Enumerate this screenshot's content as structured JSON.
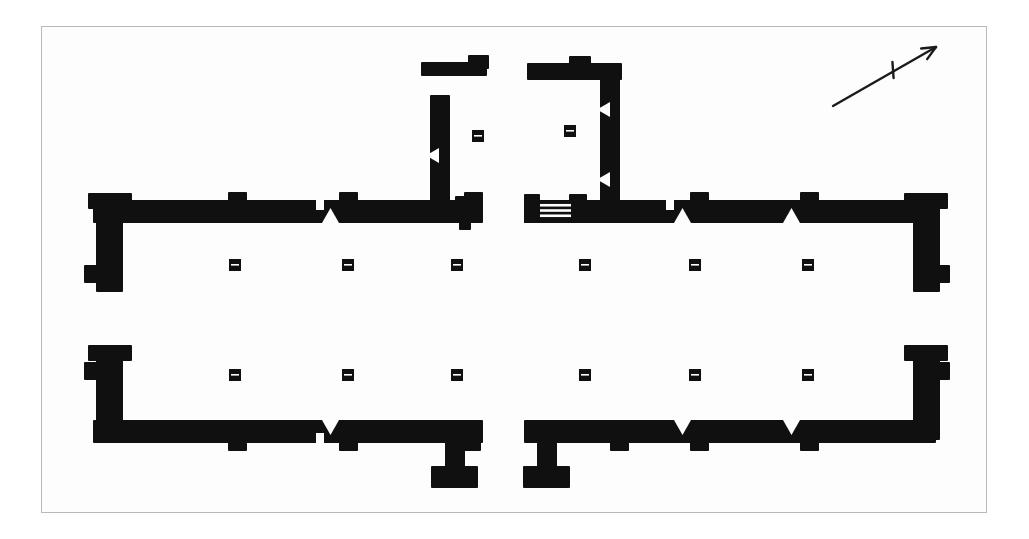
{
  "document": {
    "kind": "architectural-floor-plan",
    "title": "",
    "background_color": "#ffffff",
    "paper_color": "#fdfdfd",
    "ink_color": "#101010",
    "frame_color": "#b9b9b9"
  },
  "canvas": {
    "width": 1029,
    "height": 539
  },
  "frame": {
    "x": 41,
    "y": 26,
    "width": 946,
    "height": 487,
    "stroke": "#b9b9b9",
    "stroke_width": 1
  },
  "north_arrow": {
    "label": "north-arrow",
    "tail": {
      "x": 833,
      "y": 106
    },
    "head": {
      "x": 936,
      "y": 47
    },
    "tick_center": {
      "x": 893,
      "y": 70
    },
    "stroke": "#1b1b1b",
    "stroke_width": 2.4,
    "head_size": 15
  },
  "walls": [
    {
      "name": "upper-left-spine",
      "x": 93,
      "y": 200,
      "w": 390,
      "h": 23
    },
    {
      "name": "upper-right-spine",
      "x": 524,
      "y": 200,
      "w": 412,
      "h": 23
    },
    {
      "name": "lower-left-spine",
      "x": 93,
      "y": 420,
      "w": 390,
      "h": 23
    },
    {
      "name": "lower-right-spine",
      "x": 524,
      "y": 420,
      "w": 412,
      "h": 23
    },
    {
      "name": "upper-left-end-pier",
      "x": 96,
      "y": 204,
      "w": 27,
      "h": 88
    },
    {
      "name": "upper-right-end-pier",
      "x": 913,
      "y": 204,
      "w": 27,
      "h": 88
    },
    {
      "name": "lower-left-end-pier",
      "x": 96,
      "y": 352,
      "w": 27,
      "h": 88
    },
    {
      "name": "lower-right-end-pier",
      "x": 913,
      "y": 352,
      "w": 27,
      "h": 88
    },
    {
      "name": "upper-left-end-cap",
      "x": 88,
      "y": 193,
      "w": 44,
      "h": 16
    },
    {
      "name": "upper-right-end-cap",
      "x": 904,
      "y": 193,
      "w": 44,
      "h": 16
    },
    {
      "name": "lower-left-end-cap",
      "x": 88,
      "y": 345,
      "w": 44,
      "h": 16
    },
    {
      "name": "lower-right-end-cap",
      "x": 904,
      "y": 345,
      "w": 44,
      "h": 16
    },
    {
      "name": "upper-left-foot-spur",
      "x": 84,
      "y": 265,
      "w": 22,
      "h": 18
    },
    {
      "name": "upper-right-foot-spur",
      "x": 928,
      "y": 265,
      "w": 22,
      "h": 18
    },
    {
      "name": "lower-left-foot-spur",
      "x": 84,
      "y": 362,
      "w": 22,
      "h": 18
    },
    {
      "name": "lower-right-foot-spur",
      "x": 928,
      "y": 362,
      "w": 22,
      "h": 18
    },
    {
      "name": "court-left-cross-wall",
      "x": 430,
      "y": 95,
      "w": 20,
      "h": 112
    },
    {
      "name": "court-right-cross-wall",
      "x": 600,
      "y": 72,
      "w": 20,
      "h": 135
    },
    {
      "name": "court-right-head-wall",
      "x": 527,
      "y": 63,
      "w": 95,
      "h": 17
    },
    {
      "name": "court-right-head-knob",
      "x": 569,
      "y": 56,
      "w": 22,
      "h": 14
    },
    {
      "name": "detached-upper-wall",
      "x": 421,
      "y": 62,
      "w": 66,
      "h": 14
    },
    {
      "name": "detached-upper-knob",
      "x": 468,
      "y": 55,
      "w": 21,
      "h": 14
    },
    {
      "name": "court-left-base-pier",
      "x": 455,
      "y": 196,
      "w": 19,
      "h": 14
    },
    {
      "name": "court-left-base-foot",
      "x": 459,
      "y": 219,
      "w": 12,
      "h": 11
    },
    {
      "name": "stair-landing-block",
      "x": 524,
      "y": 194,
      "w": 16,
      "h": 29
    },
    {
      "name": "stair-right-pier",
      "x": 569,
      "y": 194,
      "w": 18,
      "h": 16
    },
    {
      "name": "lower-center-left-stem",
      "x": 445,
      "y": 441,
      "w": 20,
      "h": 35
    },
    {
      "name": "lower-center-left-foot",
      "x": 431,
      "y": 466,
      "w": 47,
      "h": 22
    },
    {
      "name": "lower-center-right-stem",
      "x": 537,
      "y": 441,
      "w": 20,
      "h": 35
    },
    {
      "name": "lower-center-right-foot",
      "x": 523,
      "y": 466,
      "w": 47,
      "h": 22
    },
    {
      "name": "upper-left-spine-pier-a",
      "x": 228,
      "y": 192,
      "w": 19,
      "h": 16
    },
    {
      "name": "upper-left-spine-pier-b",
      "x": 339,
      "y": 192,
      "w": 19,
      "h": 16
    },
    {
      "name": "upper-left-spine-pier-c",
      "x": 464,
      "y": 192,
      "w": 19,
      "h": 16
    },
    {
      "name": "upper-right-spine-pier-a",
      "x": 690,
      "y": 192,
      "w": 19,
      "h": 16
    },
    {
      "name": "upper-right-spine-pier-b",
      "x": 800,
      "y": 192,
      "w": 19,
      "h": 16
    },
    {
      "name": "lower-left-spine-pier-a",
      "x": 228,
      "y": 435,
      "w": 19,
      "h": 16
    },
    {
      "name": "lower-left-spine-pier-b",
      "x": 339,
      "y": 435,
      "w": 19,
      "h": 16
    },
    {
      "name": "lower-right-spine-pier-a",
      "x": 690,
      "y": 435,
      "w": 19,
      "h": 16
    },
    {
      "name": "lower-right-spine-pier-b",
      "x": 800,
      "y": 435,
      "w": 19,
      "h": 16
    },
    {
      "name": "lower-left-spine-pier-c",
      "x": 462,
      "y": 435,
      "w": 19,
      "h": 16
    },
    {
      "name": "lower-right-spine-pier-c",
      "x": 610,
      "y": 435,
      "w": 19,
      "h": 16
    }
  ],
  "columns": [
    {
      "name": "column-u1",
      "x": 235,
      "y": 265
    },
    {
      "name": "column-u2",
      "x": 348,
      "y": 265
    },
    {
      "name": "column-u3",
      "x": 457,
      "y": 265
    },
    {
      "name": "column-u4",
      "x": 585,
      "y": 265
    },
    {
      "name": "column-u5",
      "x": 695,
      "y": 265
    },
    {
      "name": "column-u6",
      "x": 808,
      "y": 265
    },
    {
      "name": "column-l1",
      "x": 235,
      "y": 375
    },
    {
      "name": "column-l2",
      "x": 348,
      "y": 375
    },
    {
      "name": "column-l3",
      "x": 457,
      "y": 375
    },
    {
      "name": "column-l4",
      "x": 585,
      "y": 375
    },
    {
      "name": "column-l5",
      "x": 695,
      "y": 375
    },
    {
      "name": "column-l6",
      "x": 808,
      "y": 375
    },
    {
      "name": "column-court-left",
      "x": 478,
      "y": 136
    },
    {
      "name": "column-court-right",
      "x": 570,
      "y": 131
    }
  ],
  "column_size": {
    "w": 12,
    "h": 12
  },
  "doorway_notches": [
    {
      "name": "doorway-upper-a",
      "x": 322,
      "y": 223,
      "dir": "up",
      "w": 17,
      "h": 15
    },
    {
      "name": "doorway-upper-b",
      "x": 674,
      "y": 223,
      "dir": "up",
      "w": 17,
      "h": 15
    },
    {
      "name": "doorway-upper-c",
      "x": 783,
      "y": 223,
      "dir": "up",
      "w": 17,
      "h": 15
    },
    {
      "name": "doorway-court-left",
      "x": 439,
      "y": 148,
      "dir": "left",
      "w": 13,
      "h": 15
    },
    {
      "name": "doorway-court-right-upper",
      "x": 610,
      "y": 102,
      "dir": "left",
      "w": 13,
      "h": 15
    },
    {
      "name": "doorway-court-right-lower",
      "x": 610,
      "y": 172,
      "dir": "left",
      "w": 13,
      "h": 15
    },
    {
      "name": "doorway-lower-a",
      "x": 322,
      "y": 420,
      "dir": "down",
      "w": 17,
      "h": 15
    },
    {
      "name": "doorway-lower-b",
      "x": 674,
      "y": 420,
      "dir": "down",
      "w": 17,
      "h": 15
    },
    {
      "name": "doorway-lower-c",
      "x": 783,
      "y": 420,
      "dir": "down",
      "w": 17,
      "h": 15
    }
  ],
  "stair": {
    "name": "stair-flight",
    "x": 540,
    "y": 200,
    "width": 31,
    "height": 21,
    "tread_count": 3
  },
  "wall_breaks": [
    {
      "name": "wall-break-upper-left",
      "x": 316,
      "y": 199,
      "w": 8,
      "h": 11
    },
    {
      "name": "wall-break-lower-left",
      "x": 316,
      "y": 433,
      "w": 8,
      "h": 11
    },
    {
      "name": "wall-break-upper-right",
      "x": 666,
      "y": 199,
      "w": 8,
      "h": 11
    }
  ]
}
